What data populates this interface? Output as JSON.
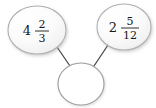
{
  "diagram": {
    "type": "number-bond",
    "background_color": "#ffffff",
    "node_fill_color": "#fafafa",
    "node_stroke_color": "#b0b0b0",
    "connector_color": "#4a4a4a",
    "text_color": "#16181a",
    "nodes": [
      {
        "id": "addend-left",
        "role": "addend",
        "filled": true,
        "whole": "4",
        "numerator": "2",
        "denominator": "3",
        "value_text": "4 2/3",
        "cx": 37,
        "cy": 30,
        "rx": 29,
        "ry": 24
      },
      {
        "id": "addend-right",
        "role": "addend",
        "filled": true,
        "whole": "2",
        "numerator": "5",
        "denominator": "12",
        "value_text": "2 5/12",
        "cx": 124,
        "cy": 27,
        "rx": 27,
        "ry": 23
      },
      {
        "id": "sum-empty",
        "role": "sum",
        "filled": false,
        "whole": "",
        "numerator": "",
        "denominator": "",
        "value_text": "",
        "cx": 81,
        "cy": 84,
        "rx": 23,
        "ry": 21
      }
    ],
    "connectors": [
      {
        "id": "connector-left",
        "from": "addend-left",
        "to": "sum-empty",
        "x1": 57,
        "y1": 47,
        "x2": 70,
        "y2": 66
      },
      {
        "id": "connector-right",
        "from": "addend-right",
        "to": "sum-empty",
        "x1": 108,
        "y1": 45,
        "x2": 94,
        "y2": 66
      }
    ]
  }
}
